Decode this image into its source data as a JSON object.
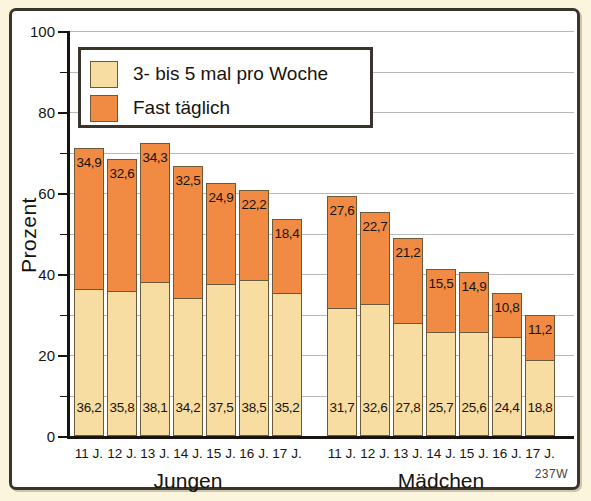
{
  "chart_data": {
    "type": "bar",
    "title": "",
    "xlabel": "",
    "ylabel": "Prozent",
    "ylim": [
      0,
      100
    ],
    "ytick_step": 20,
    "gridline_step": 10,
    "grid": true,
    "stacked": true,
    "legend_position": "top-left",
    "ytick_labels": [
      "0",
      "20",
      "40",
      "60",
      "80",
      "100"
    ],
    "legend": [
      {
        "label": "3- bis 5 mal pro Woche",
        "color": "#f8dda2",
        "key": "weekly"
      },
      {
        "label": "Fast täglich",
        "color": "#f18a42",
        "key": "daily"
      }
    ],
    "groups": [
      {
        "name": "Jungen",
        "categories": [
          "11 J.",
          "12 J.",
          "13 J.",
          "14 J.",
          "15 J.",
          "16 J.",
          "17 J."
        ]
      },
      {
        "name": "Mädchen",
        "categories": [
          "11 J.",
          "12 J.",
          "13 J.",
          "14 J.",
          "15 J.",
          "16 J.",
          "17 J."
        ]
      }
    ],
    "categories": [
      "11 J.",
      "12 J.",
      "13 J.",
      "14 J.",
      "15 J.",
      "16 J.",
      "17 J.",
      "11 J.",
      "12 J.",
      "13 J.",
      "14 J.",
      "15 J.",
      "16 J.",
      "17 J."
    ],
    "series": [
      {
        "name": "3- bis 5 mal pro Woche",
        "color": "#f8dda2",
        "values": [
          36.2,
          35.8,
          38.1,
          34.2,
          37.5,
          38.5,
          35.2,
          31.7,
          32.6,
          27.8,
          25.7,
          25.6,
          24.4,
          18.8
        ],
        "labels": [
          "36,2",
          "35,8",
          "38,1",
          "34,2",
          "37,5",
          "38,5",
          "35,2",
          "31,7",
          "32,6",
          "27,8",
          "25,7",
          "25,6",
          "24,4",
          "18,8"
        ]
      },
      {
        "name": "Fast täglich",
        "color": "#f18a42",
        "values": [
          34.9,
          32.6,
          34.3,
          32.5,
          24.9,
          22.2,
          18.4,
          27.6,
          22.7,
          21.2,
          15.5,
          14.9,
          10.8,
          11.2
        ],
        "labels": [
          "34,9",
          "32,6",
          "34,3",
          "32,5",
          "24,9",
          "22,2",
          "18,4",
          "27,6",
          "22,7",
          "21,2",
          "15,5",
          "14,9",
          "10,8",
          "11,2"
        ]
      }
    ],
    "totals": [
      71.1,
      68.4,
      72.4,
      66.7,
      62.4,
      60.7,
      53.6,
      59.3,
      55.3,
      49.0,
      41.2,
      40.5,
      35.2,
      30.0
    ]
  },
  "corner_code": "237W",
  "colors": {
    "weekly": "#f8dda2",
    "daily": "#f18a42",
    "frame": "#3a352c",
    "background": "#faf5dc",
    "plot_background": "#ffffff",
    "grid": "#b9b9b9",
    "axis": "#17140f"
  }
}
